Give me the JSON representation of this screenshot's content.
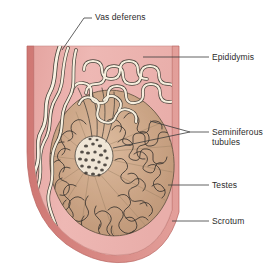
{
  "figure": {
    "background_color": "#ffffff",
    "colors": {
      "scrotum_wall": "#d4807c",
      "scrotum_wall_dark": "#c9706c",
      "scrotum_interior": "#e8aeab",
      "scrotum_interior_light": "#efc0bc",
      "testis_fill": "#c8a183",
      "testis_fill_light": "#d6b396",
      "tubule_fill": "#f4ecdc",
      "tubule_stroke": "#3b3530",
      "vas_fill": "#f6eedd",
      "vas_stroke": "#4a443c",
      "outline": "#5a4f46",
      "leader_line": "#3a3a3a",
      "label_text": "#2b2b2b"
    }
  },
  "labels": [
    {
      "id": "vas-deferens",
      "text": "Vas deferens",
      "x": 95,
      "y": 12,
      "leader": "M 92 18 L 84 18 L 62 50"
    },
    {
      "id": "epididymis",
      "text": "Epididymis",
      "x": 212,
      "y": 53,
      "leader": "M 209 57 L 143 57"
    },
    {
      "id": "seminiferous-tubules",
      "text": "Seminiferous\ntubules",
      "x": 212,
      "y": 127,
      "leader_a": "M 209 132 L 190 132 L 150 121",
      "leader_b": "M 209 132 L 190 132 L 113 148"
    },
    {
      "id": "testes",
      "text": "Testes",
      "x": 212,
      "y": 180,
      "leader": "M 209 185 L 168 185"
    },
    {
      "id": "scrotum",
      "text": "Scrotum",
      "x": 212,
      "y": 216,
      "leader": "M 209 221 L 172 221"
    }
  ],
  "structures": [
    {
      "id": "scrotum-wall",
      "name": "scrotum wall"
    },
    {
      "id": "scrotum-interior",
      "name": "scrotum interior"
    },
    {
      "id": "testis-body",
      "name": "testis body"
    },
    {
      "id": "seminiferous-tubule-mass",
      "name": "seminiferous tubules"
    },
    {
      "id": "rete-testis",
      "name": "rete testis"
    },
    {
      "id": "epididymis-coil",
      "name": "epididymis coil"
    },
    {
      "id": "vas-deferens-duct",
      "name": "vas deferens duct"
    },
    {
      "id": "spermatic-cord-vessels",
      "name": "spermatic cord vessels"
    },
    {
      "id": "efferent-ductules",
      "name": "efferent ductules"
    }
  ]
}
